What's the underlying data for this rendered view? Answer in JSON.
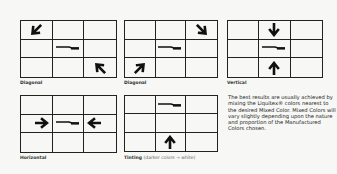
{
  "diagrams": [
    {
      "label": "Diagonal",
      "arrows": [
        {
          "row": 1,
          "col": 1,
          "dir": "down-right"
        },
        {
          "row": 3,
          "col": 3,
          "dir": "up-left"
        }
      ],
      "mix_cell": {
        "row": 2,
        "col": 2
      }
    },
    {
      "label": "Diagonal",
      "arrows": [
        {
          "row": 1,
          "col": 3,
          "dir": "down-left"
        },
        {
          "row": 3,
          "col": 1,
          "dir": "up-right"
        }
      ],
      "mix_cell": {
        "row": 2,
        "col": 2
      }
    },
    {
      "label": "Vertical",
      "arrows": [
        {
          "row": 1,
          "col": 2,
          "dir": "down"
        },
        {
          "row": 3,
          "col": 2,
          "dir": "up"
        }
      ],
      "mix_cell": {
        "row": 2,
        "col": 2
      }
    },
    {
      "label": "Horizontal",
      "arrows": [
        {
          "row": 2,
          "col": 1,
          "dir": "right"
        },
        {
          "row": 2,
          "col": 3,
          "dir": "left"
        }
      ],
      "mix_cell": {
        "row": 2,
        "col": 2
      }
    },
    {
      "label": "Tinting",
      "sublabel": "(darker colors → white)",
      "arrows": [
        {
          "row": 3,
          "col": 2,
          "dir": "up"
        }
      ],
      "mix_cell": {
        "row": 1,
        "col": 2
      }
    }
  ],
  "note": "The best results are usually achieved by mixing the Liquitex® colors nearest to the desired Mixed Color. Mixed Colors will vary slightly depending upon the nature and proportion of the Manufactured Colors chosen.",
  "colors": {
    "ink": "#1a1a1a",
    "background": "#f7f7f5"
  }
}
